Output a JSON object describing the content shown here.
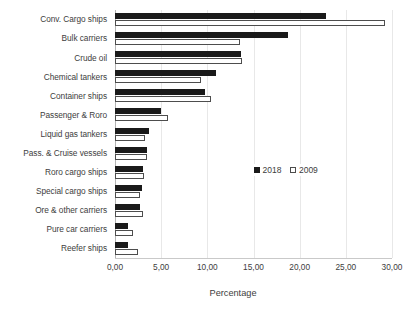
{
  "chart_data": {
    "type": "bar",
    "orientation": "horizontal",
    "title": "",
    "xlabel": "Percentage",
    "ylabel": "",
    "xlim": [
      0,
      30
    ],
    "xticks": [
      0,
      5,
      10,
      15,
      20,
      25,
      30
    ],
    "xtick_labels": [
      "0,00",
      "5,00",
      "10,00",
      "15,00",
      "20,00",
      "25,00",
      "30,00"
    ],
    "grid": true,
    "grid_axis": "x",
    "legend_position": "center-right",
    "categories": [
      "Conv. Cargo ships",
      "Bulk carriers",
      "Crude oil",
      "Chemical tankers",
      "Container ships",
      "Passenger & Roro",
      "Liquid gas tankers",
      "Pass. & Cruise vessels",
      "Roro cargo ships",
      "Special cargo ships",
      "Ore & other carriers",
      "Pure car carriers",
      "Reefer ships"
    ],
    "series": [
      {
        "name": "2018",
        "color": "#1a1a1a",
        "values": [
          22.8,
          18.7,
          13.7,
          10.9,
          9.8,
          5.0,
          3.7,
          3.5,
          3.0,
          2.9,
          2.7,
          1.4,
          1.4
        ]
      },
      {
        "name": "2009",
        "color": "#ffffff",
        "edge_color": "#4d4d4d",
        "values": [
          29.2,
          13.5,
          13.8,
          9.3,
          10.4,
          5.7,
          3.3,
          3.5,
          3.1,
          2.7,
          3.0,
          2.0,
          2.5
        ]
      }
    ]
  },
  "legend": {
    "entries": [
      {
        "label": "2018"
      },
      {
        "label": "2009"
      }
    ]
  },
  "axis": {
    "x_title": "Percentage"
  }
}
